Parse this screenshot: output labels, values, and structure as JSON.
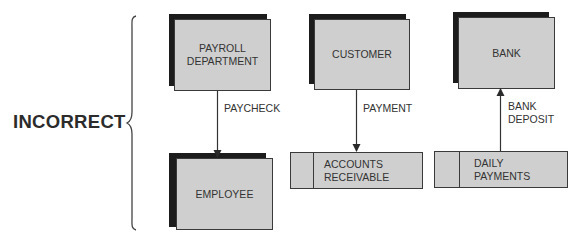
{
  "diagram": {
    "title_label": "INCORRECT",
    "colors": {
      "entity_fill": "#cfcfcf",
      "entity_shadow": "#1c1c1c",
      "stroke": "#3a3a3a",
      "text": "#333333"
    },
    "entities": [
      {
        "id": "payroll",
        "label": "PAYROLL\nDEPARTMENT"
      },
      {
        "id": "employee",
        "label": "EMPLOYEE"
      },
      {
        "id": "customer",
        "label": "CUSTOMER"
      },
      {
        "id": "bank",
        "label": "BANK"
      }
    ],
    "data_stores": [
      {
        "id": "accounts-receivable",
        "label": "ACCOUNTS\nRECEIVABLE"
      },
      {
        "id": "daily-payments",
        "label": "DAILY\nPAYMENTS"
      }
    ],
    "flows": [
      {
        "from": "PAYROLL DEPARTMENT",
        "to": "EMPLOYEE",
        "label": "PAYCHECK"
      },
      {
        "from": "CUSTOMER",
        "to": "ACCOUNTS RECEIVABLE",
        "label": "PAYMENT"
      },
      {
        "from": "DAILY PAYMENTS",
        "to": "BANK",
        "label": "BANK\nDEPOSIT"
      }
    ]
  }
}
